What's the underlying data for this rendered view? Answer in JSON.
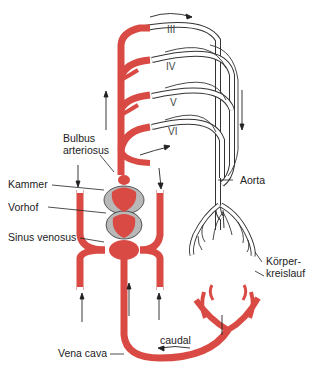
{
  "diagram": {
    "type": "vascular-system-diagram",
    "colors": {
      "venous_blood": "#d94a44",
      "heart_pericardium": "#b8b8b8",
      "arterial_outline": "#333333",
      "background": "#ffffff"
    },
    "arch_labels": [
      "III",
      "IV",
      "V",
      "VI"
    ],
    "labels": {
      "bulbus": "Bulbus",
      "arteriosus": "arteriosus",
      "kammer": "Kammer",
      "vorhof": "Vorhof",
      "sinus_venosus": "Sinus venosus",
      "aorta": "Aorta",
      "koerper": "Körper-",
      "kreislauf": "kreislauf",
      "caudal": "caudal",
      "vena_cava": "Vena cava"
    }
  }
}
